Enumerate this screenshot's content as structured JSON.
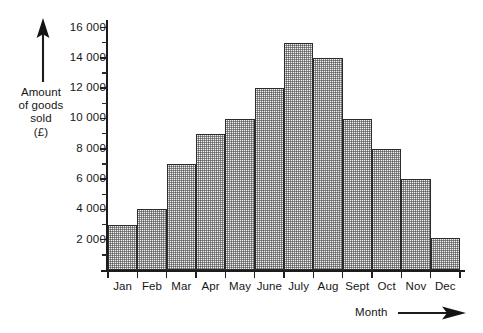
{
  "chart_data": {
    "type": "bar",
    "title": "",
    "subtitle": "",
    "xlabel": "Month",
    "ylabel": "Amount of goods sold (£)",
    "ylabel_lines": [
      "Amount",
      "of goods",
      "sold",
      "(£)"
    ],
    "categories": [
      "Jan",
      "Feb",
      "Mar",
      "Apr",
      "May",
      "June",
      "July",
      "Aug",
      "Sept",
      "Oct",
      "Nov",
      "Dec"
    ],
    "values": [
      3000,
      4000,
      7000,
      9000,
      10000,
      12000,
      15000,
      14000,
      10000,
      8000,
      6000,
      2100
    ],
    "ylim": [
      0,
      16500
    ],
    "y_major_ticks": [
      2000,
      4000,
      6000,
      8000,
      10000,
      12000,
      14000,
      16000
    ],
    "y_tick_labels": [
      "2 000",
      "4 000",
      "6 000",
      "8 000",
      "10 000",
      "12 000",
      "14 000",
      "16 000"
    ],
    "y_minor_ticks": [
      1000,
      3000,
      5000,
      7000,
      9000,
      11000,
      13000,
      15000,
      16000
    ],
    "grid": false,
    "legend": false,
    "bar_fill": "#f2f2f2",
    "bar_edge": "#2b2b2b",
    "axis_color": "#1c1c1c",
    "text_color": "#161616",
    "x_axis_arrow": "right-arrow-icon",
    "y_axis_arrow": "up-arrow-icon"
  }
}
